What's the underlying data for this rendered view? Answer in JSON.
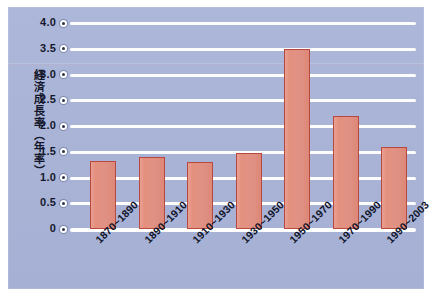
{
  "chart_data": {
    "type": "bar",
    "title": "",
    "xlabel": "",
    "ylabel": "経済成長率（年率）",
    "categories": [
      "1870~1890",
      "1890~1910",
      "1910~1930",
      "1930~1950",
      "1950~1970",
      "1970~1990",
      "1990~2003"
    ],
    "values": [
      1.33,
      1.4,
      1.3,
      1.48,
      3.5,
      2.2,
      1.6
    ],
    "ylim": [
      0,
      4.0
    ],
    "ytick_labels": [
      "4.0",
      "3.5",
      "3.0",
      "2.5",
      "2.0",
      "1.5",
      "1.0",
      "0.5",
      "0"
    ],
    "ytick_values": [
      4.0,
      3.5,
      3.0,
      2.5,
      2.0,
      1.5,
      1.0,
      0.5,
      0
    ],
    "grid": true,
    "legend": "none",
    "colors": {
      "panel_background": "#aab4d8",
      "bar_fill": "#e09184",
      "bar_border": "#b8483d",
      "gridline": "#ffffff",
      "text": "#12162b",
      "figure_background": "#ffffff"
    }
  }
}
